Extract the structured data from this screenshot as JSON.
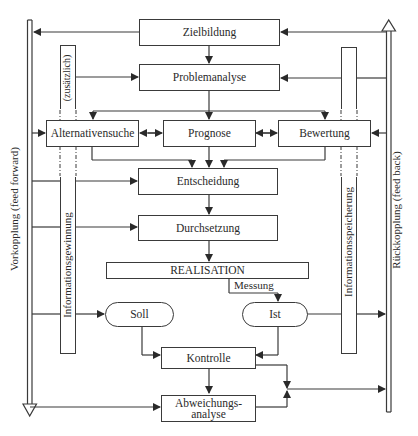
{
  "boxes": {
    "zielbildung": "Zielbildung",
    "problemanalyse": "Problemanalyse",
    "alternativensuche": "Alternativensuche",
    "prognose": "Prognose",
    "bewertung": "Bewertung",
    "entscheidung": "Entscheidung",
    "durchsetzung": "Durchsetzung",
    "realisation": "REALISATION",
    "soll": "Soll",
    "ist": "Ist",
    "kontrolle": "Kontrolle",
    "abweichungsanalyse_line1": "Abweichungs-",
    "abweichungsanalyse_line2": "analyse"
  },
  "labels": {
    "messung": "Messung",
    "zusaetzlich": "(zusätzlich)",
    "informationsgewinnung": "Informationsgewinnung",
    "informationsspeicherung": "Informationsspeicherung",
    "vorkopplung": "Vorkopplung (feed forward)",
    "rueckkopplung": "Rückkopplung (feed back)"
  },
  "colors": {
    "line": "#3a3a3a",
    "background": "#ffffff"
  }
}
